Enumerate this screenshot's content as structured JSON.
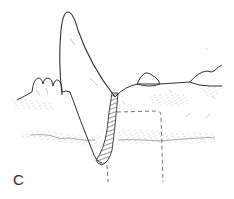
{
  "figure": {
    "panel_label": "C",
    "colors": {
      "line": "#333333",
      "stipple": "#b8b8b8",
      "dash": "#666666",
      "background": "#ffffff"
    },
    "elements": [
      "flame-shaped-mound",
      "hatched-wall",
      "left-lumps",
      "ground-surface-line",
      "rock",
      "right-mound",
      "dashed-pit-outline",
      "soil-horizon-stipple"
    ]
  }
}
